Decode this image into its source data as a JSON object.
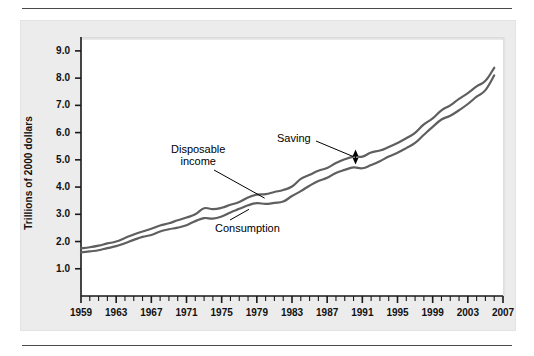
{
  "figure": {
    "panel_bg": "#ececec",
    "plot_bg": "#ffffff",
    "line_color": "#5f5f5f",
    "text_color": "#111111"
  },
  "chart_data": {
    "type": "line",
    "title": "",
    "subtitle": "",
    "xlabel": "",
    "ylabel": "Trillions of 2000 dollars",
    "xlim": [
      1959,
      2007
    ],
    "ylim": [
      0.0,
      9.4
    ],
    "grid": false,
    "legend_position": "inline-annotations",
    "y_ticks": [
      "9.0",
      "8.0",
      "7.0",
      "6.0",
      "5.0",
      "4.0",
      "3.0",
      "2.0",
      "1.0"
    ],
    "y_tick_values": [
      9.0,
      8.0,
      7.0,
      6.0,
      5.0,
      4.0,
      3.0,
      2.0,
      1.0
    ],
    "x_ticks": [
      "1959",
      "1963",
      "1967",
      "1971",
      "1975",
      "1979",
      "1983",
      "1987",
      "1991",
      "1995",
      "1999",
      "2003",
      "2007"
    ],
    "x_tick_values": [
      1959,
      1963,
      1967,
      1971,
      1975,
      1979,
      1983,
      1987,
      1991,
      1995,
      1999,
      2003,
      2007
    ],
    "x_minor_tick_interval": 1,
    "x": [
      1959,
      1960,
      1961,
      1962,
      1963,
      1964,
      1965,
      1966,
      1967,
      1968,
      1969,
      1970,
      1971,
      1972,
      1973,
      1974,
      1975,
      1976,
      1977,
      1978,
      1979,
      1980,
      1981,
      1982,
      1983,
      1984,
      1985,
      1986,
      1987,
      1988,
      1989,
      1990,
      1991,
      1992,
      1993,
      1994,
      1995,
      1996,
      1997,
      1998,
      1999,
      2000,
      2001,
      2002,
      2003,
      2004,
      2005,
      2006
    ],
    "series": [
      {
        "name": "Disposable income",
        "color": "#5f5f5f",
        "values": [
          1.75,
          1.79,
          1.85,
          1.93,
          2.0,
          2.13,
          2.26,
          2.37,
          2.47,
          2.59,
          2.67,
          2.78,
          2.88,
          3.0,
          3.22,
          3.19,
          3.24,
          3.35,
          3.45,
          3.62,
          3.72,
          3.74,
          3.82,
          3.89,
          4.02,
          4.3,
          4.45,
          4.6,
          4.7,
          4.88,
          5.02,
          5.12,
          5.12,
          5.27,
          5.34,
          5.47,
          5.62,
          5.79,
          5.99,
          6.3,
          6.52,
          6.82,
          7.0,
          7.24,
          7.45,
          7.7,
          7.9,
          8.38
        ],
        "marker": "none",
        "linewidth": 2.2
      },
      {
        "name": "Consumption",
        "color": "#5f5f5f",
        "values": [
          1.6,
          1.64,
          1.68,
          1.76,
          1.83,
          1.94,
          2.06,
          2.17,
          2.24,
          2.37,
          2.45,
          2.51,
          2.6,
          2.75,
          2.86,
          2.84,
          2.92,
          3.07,
          3.2,
          3.33,
          3.41,
          3.38,
          3.42,
          3.47,
          3.67,
          3.85,
          4.05,
          4.22,
          4.34,
          4.52,
          4.63,
          4.72,
          4.69,
          4.81,
          4.95,
          5.12,
          5.26,
          5.43,
          5.62,
          5.92,
          6.21,
          6.48,
          6.62,
          6.82,
          7.05,
          7.32,
          7.56,
          8.1
        ],
        "marker": "none",
        "linewidth": 2.2
      }
    ],
    "annotations": [
      {
        "id": "disposable-income",
        "label_lines": [
          "Disposable",
          "income"
        ],
        "label": "Disposable income",
        "points_to_series": "Disposable income",
        "points_to_x": 1980
      },
      {
        "id": "consumption",
        "label_lines": [
          "Consumption"
        ],
        "label": "Consumption",
        "points_to_series": "Consumption",
        "points_to_x": 1978
      },
      {
        "id": "saving",
        "label_lines": [
          "Saving"
        ],
        "label": "Saving",
        "points_to_x": 1990,
        "arrow": "double-headed-vertical",
        "span_from": 4.85,
        "span_to": 5.38
      }
    ]
  }
}
